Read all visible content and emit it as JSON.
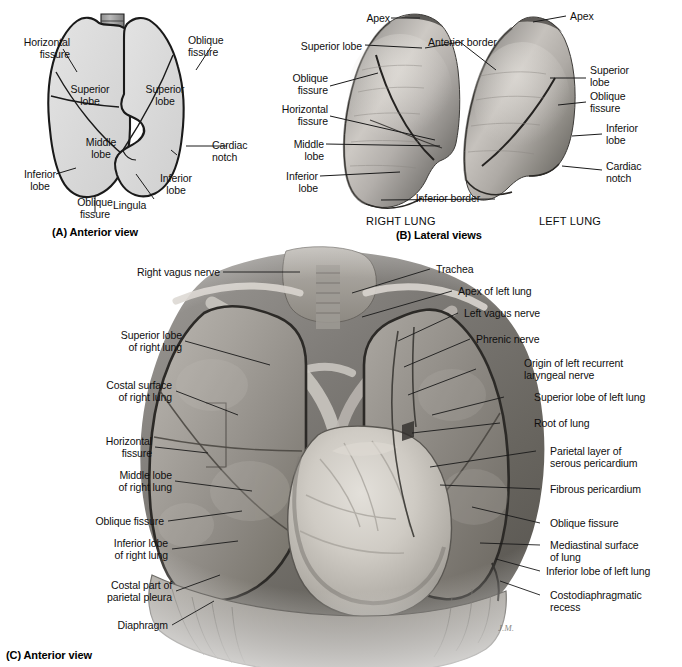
{
  "figure": {
    "background_color": "#ffffff",
    "ink_color": "#111111",
    "artist_signature": "J.M."
  },
  "panel_a": {
    "caption": "(A) Anterior view",
    "labels": {
      "horizontal_fissure": "Horizontal\nfissure",
      "superior_lobe_right": "Superior\nlobe",
      "middle_lobe": "Middle\nlobe",
      "inferior_lobe_right": "Inferior\nlobe",
      "oblique_fissure_left_bottom": "Oblique\nfissure",
      "oblique_fissure_right_top": "Oblique\nfissure",
      "superior_lobe_left": "Superior\nlobe",
      "cardiac_notch": "Cardiac\nnotch",
      "inferior_lobe_left": "Inferior\nlobe",
      "lingula": "Lingula"
    }
  },
  "panel_b": {
    "caption": "(B) Lateral views",
    "specimen_left_name": "RIGHT LUNG",
    "specimen_right_name": "LEFT LUNG",
    "labels": {
      "apex_right": "Apex",
      "superior_lobe_right": "Superior lobe",
      "oblique_fissure_right": "Oblique\nfissure",
      "horizontal_fissure_right": "Horizontal\nfissure",
      "middle_lobe_right": "Middle\nlobe",
      "inferior_lobe_right": "Inferior\nlobe",
      "anterior_border": "Anterior border",
      "inferior_border": "Inferior border",
      "apex_left": "Apex",
      "superior_lobe_left": "Superior\nlobe",
      "oblique_fissure_left": "Oblique\nfissure",
      "inferior_lobe_left": "Inferior\nlobe",
      "cardiac_notch_left": "Cardiac\nnotch"
    }
  },
  "panel_c": {
    "caption": "(C) Anterior view",
    "labels_left": [
      "Right vagus nerve",
      "Superior lobe\nof right lung",
      "Costal surface\nof right lung",
      "Horizontal\nfissure",
      "Middle lobe\nof right lung",
      "Oblique fissure",
      "Inferior lobe\nof right lung",
      "Costal part of\nparietal pleura",
      "Diaphragm"
    ],
    "labels_right": [
      "Trachea",
      "Apex of left lung",
      "Left vagus nerve",
      "Phrenic nerve",
      "Origin of left recurrent\nlaryngeal nerve",
      "Superior lobe of left lung",
      "Root of lung",
      "Parietal layer of\nserous pericardium",
      "Fibrous pericardium",
      "Oblique fissure",
      "Mediastinal surface\nof lung",
      "Inferior lobe of left lung",
      "Costodiaphragmatic\nrecess"
    ]
  }
}
